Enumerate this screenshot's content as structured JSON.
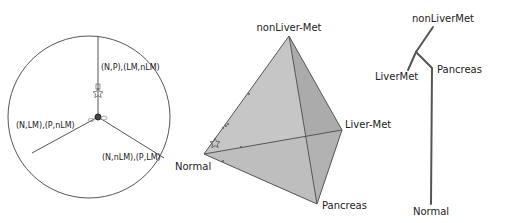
{
  "circle_panel": {
    "labels": {
      "top": "(N,P),(LM,nLM)",
      "left": "(N,LM),(P,nLM)",
      "right": "(N,nLM),(P,LM)"
    }
  },
  "tetrahedron_panel": {
    "vertices": {
      "top": "nonLiver-Met",
      "right": "Liver-Met",
      "bottom": "Pancreas",
      "left": "Normal"
    }
  },
  "tree_panel": {
    "leaves": {
      "top": "nonLiverMet",
      "left": "LiverMet",
      "right": "Pancreas",
      "bottom": "Normal"
    }
  },
  "colors": {
    "line": "#555555",
    "face_light": "#c9c9c9",
    "face_mid": "#b5b5b5",
    "face_dark": "#a3a3a3",
    "tree": "#555555"
  }
}
